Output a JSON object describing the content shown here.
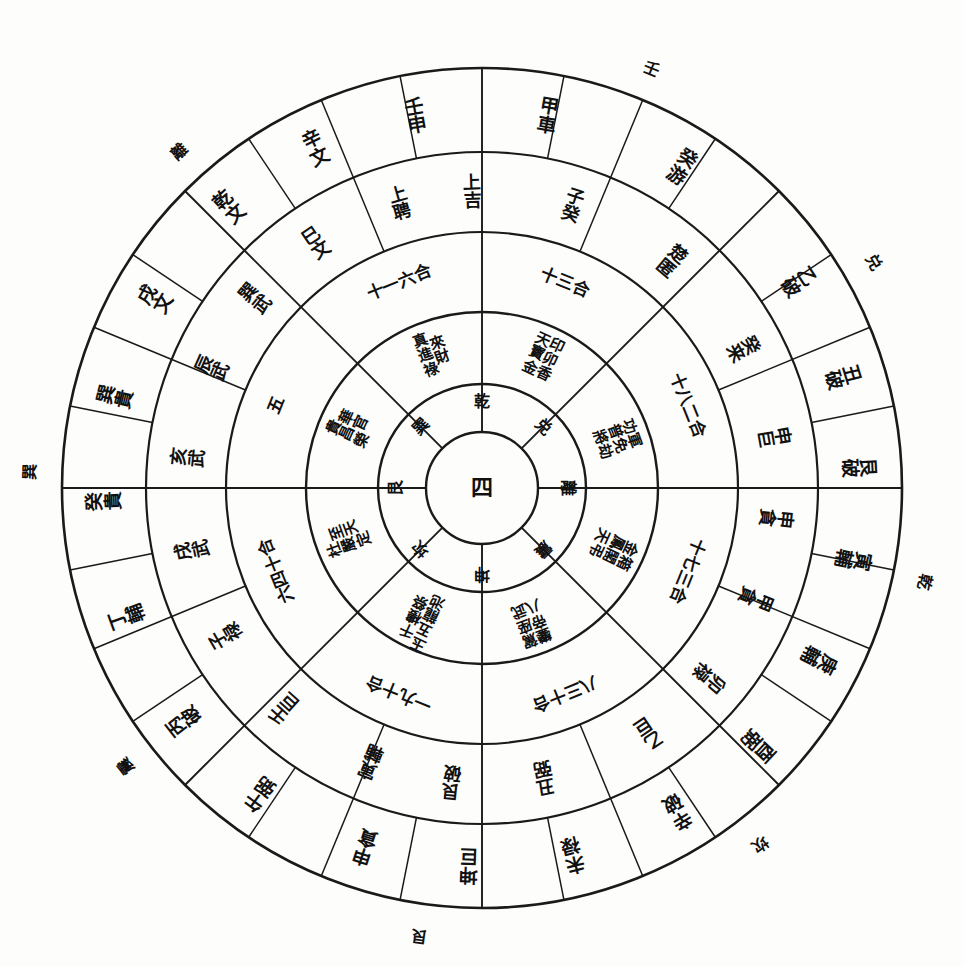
{
  "chart_data": {
    "type": "diagram",
    "title": "",
    "subtitle": "",
    "layout": {
      "center_x": 482,
      "center_y": 488,
      "radii": {
        "outside_labels": 452,
        "ring_outer": 420,
        "ring_mid": 336,
        "ring_sector": 256,
        "ring_inner": 176,
        "ring_core": 104,
        "ring_center": 56
      },
      "rings": 5,
      "sectors": 8,
      "grid": false,
      "legend": "none"
    }
  },
  "outside_labels": [
    {
      "text": "壬",
      "angle": 22
    },
    {
      "text": "兑",
      "angle": 60
    },
    {
      "text": "乾",
      "angle": 102
    },
    {
      "text": "坎",
      "angle": 142
    },
    {
      "text": "艮",
      "angle": 188
    },
    {
      "text": "震",
      "angle": 232
    },
    {
      "text": "巽",
      "angle": 272
    },
    {
      "text": "離",
      "angle": 318
    }
  ],
  "outer_ring": {
    "name": "outer-ring",
    "cells": [
      {
        "angle": 10,
        "glyphs": [
          "甲",
          "車"
        ]
      },
      {
        "angle": 32,
        "glyphs": [
          "癸",
          "游"
        ]
      },
      {
        "angle": 57,
        "glyphs": [
          "乙",
          "破"
        ]
      },
      {
        "angle": 73,
        "glyphs": [
          "丑",
          "破"
        ]
      },
      {
        "angle": 87,
        "glyphs": [
          "艮",
          "破"
        ]
      },
      {
        "angle": 101,
        "glyphs": [
          "寅",
          "輔"
        ]
      },
      {
        "angle": 117,
        "glyphs": [
          "庚",
          "輔"
        ]
      },
      {
        "angle": 133,
        "glyphs": [
          "酉",
          "弼"
        ]
      },
      {
        "angle": 149,
        "glyphs": [
          "辛",
          "破"
        ]
      },
      {
        "angle": 166,
        "glyphs": [
          "未",
          "禄"
        ]
      },
      {
        "angle": 182,
        "glyphs": [
          "坤",
          "巨"
        ]
      },
      {
        "angle": 198,
        "glyphs": [
          "申",
          "貪"
        ]
      },
      {
        "angle": 216,
        "glyphs": [
          "午",
          "弼"
        ]
      },
      {
        "angle": 232,
        "glyphs": [
          "丙",
          "破"
        ]
      },
      {
        "angle": 250,
        "glyphs": [
          "丁",
          "輔"
        ]
      },
      {
        "angle": 268,
        "glyphs": [
          "癸",
          "貴"
        ]
      },
      {
        "angle": 284,
        "glyphs": [
          "巽",
          "貴"
        ]
      },
      {
        "angle": 300,
        "glyphs": [
          "戌",
          "文"
        ]
      },
      {
        "angle": 318,
        "glyphs": [
          "乾",
          "文"
        ]
      },
      {
        "angle": 334,
        "glyphs": [
          "辛",
          "文"
        ]
      },
      {
        "angle": 350,
        "glyphs": [
          "壬",
          "申"
        ]
      }
    ]
  },
  "mid_ring": {
    "name": "mid-ring",
    "cells": [
      {
        "angle": 18,
        "glyphs": [
          "子",
          "癸"
        ]
      },
      {
        "angle": 40,
        "glyphs": [
          "楚",
          "匿"
        ]
      },
      {
        "angle": 62,
        "glyphs": [
          "癸",
          "来"
        ]
      },
      {
        "angle": 80,
        "glyphs": [
          "申",
          "巨"
        ]
      },
      {
        "angle": 96,
        "glyphs": [
          "申",
          "貪"
        ]
      },
      {
        "angle": 112,
        "glyphs": [
          "甲",
          "貪"
        ]
      },
      {
        "angle": 130,
        "glyphs": [
          "卯",
          "禄"
        ]
      },
      {
        "angle": 146,
        "glyphs": [
          "乙",
          "巨"
        ]
      },
      {
        "angle": 168,
        "glyphs": [
          "丑",
          "弼"
        ]
      },
      {
        "angle": 186,
        "glyphs": [
          "艮",
          "破"
        ]
      },
      {
        "angle": 202,
        "glyphs": [
          "寅",
          "輔"
        ]
      },
      {
        "angle": 222,
        "glyphs": [
          "壬",
          "巨"
        ]
      },
      {
        "angle": 240,
        "glyphs": [
          "子",
          "禄"
        ]
      },
      {
        "angle": 258,
        "glyphs": [
          "戌",
          "武"
        ]
      },
      {
        "angle": 276,
        "glyphs": [
          "亥",
          "武"
        ]
      },
      {
        "angle": 294,
        "glyphs": [
          "辰",
          "武"
        ]
      },
      {
        "angle": 310,
        "glyphs": [
          "巽",
          "武"
        ]
      },
      {
        "angle": 326,
        "glyphs": [
          "巳",
          "文"
        ]
      },
      {
        "angle": 344,
        "glyphs": [
          "上",
          "聘"
        ]
      },
      {
        "angle": 358,
        "glyphs": [
          "上",
          "吉"
        ]
      }
    ]
  },
  "sector_ring": {
    "name": "sector-number-ring",
    "cells": [
      {
        "angle": 22,
        "glyphs": [
          "十",
          "三",
          "合"
        ]
      },
      {
        "angle": 68,
        "glyphs": [
          "十",
          "八",
          "二",
          "合"
        ]
      },
      {
        "angle": 112,
        "glyphs": [
          "十",
          "七",
          "三",
          "合"
        ]
      },
      {
        "angle": 158,
        "glyphs": [
          "八",
          "三",
          "十",
          "合"
        ]
      },
      {
        "angle": 202,
        "glyphs": [
          "一",
          "九",
          "十",
          "合"
        ]
      },
      {
        "angle": 248,
        "glyphs": [
          "六",
          "四",
          "十",
          "合"
        ]
      },
      {
        "angle": 292,
        "glyphs": [
          "五"
        ]
      },
      {
        "angle": 338,
        "glyphs": [
          "十",
          "一",
          "六",
          "合"
        ]
      }
    ]
  },
  "inner_ring": {
    "name": "inner-ring",
    "cells": [
      {
        "angle": 25,
        "glyphs": [
          "天",
          "寶",
          "金",
          "印",
          "卯",
          "香"
        ]
      },
      {
        "angle": 70,
        "glyphs": [
          "功",
          "普",
          "將",
          "軍",
          "免",
          "劫"
        ]
      },
      {
        "angle": 115,
        "glyphs": [
          "金",
          "鳳",
          "天",
          "箱",
          "閣",
          "弔"
        ]
      },
      {
        "angle": 160,
        "glyphs": [
          "鑾",
          "帝",
          "八",
          "駕",
          "座",
          "武"
        ]
      },
      {
        "angle": 205,
        "glyphs": [
          "玉",
          "五",
          "龍",
          "池",
          "千",
          "樓",
          "祭"
        ]
      },
      {
        "angle": 250,
        "glyphs": [
          "杜",
          "嚴",
          "定",
          "至",
          "天"
        ]
      },
      {
        "angle": 295,
        "glyphs": [
          "貴",
          "昌",
          "榮",
          "華",
          "官"
        ]
      },
      {
        "angle": 340,
        "glyphs": [
          "真",
          "進",
          "祿",
          "來",
          "財"
        ]
      }
    ]
  },
  "core_ring": {
    "name": "core-trigram-ring",
    "center_glyph": "四",
    "trigrams": [
      {
        "text": "乾",
        "angle": 0
      },
      {
        "text": "兑",
        "angle": 45
      },
      {
        "text": "離",
        "angle": 90
      },
      {
        "text": "震",
        "angle": 135
      },
      {
        "text": "坤",
        "angle": 180
      },
      {
        "text": "坎",
        "angle": 225
      },
      {
        "text": "艮",
        "angle": 270
      },
      {
        "text": "巽",
        "angle": 315
      }
    ]
  }
}
